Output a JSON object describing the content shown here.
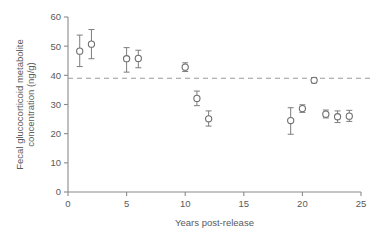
{
  "chart_data": {
    "type": "scatter",
    "title": "",
    "xlabel": "Years post-release",
    "ylabel": "Fecal glucocorticoid metabolite concentration (ng/g)",
    "ylabel_line1": "Fecal glucocorticoid metabolite",
    "ylabel_line2": "concentration (ng/g)",
    "xlim": [
      0,
      25
    ],
    "ylim": [
      0,
      60
    ],
    "xticks": [
      0,
      5,
      10,
      15,
      20,
      25
    ],
    "yticks": [
      0,
      10,
      20,
      30,
      40,
      50,
      60
    ],
    "xtick_labels": [
      "0",
      "5",
      "10",
      "15",
      "20",
      "25"
    ],
    "ytick_labels": [
      "0",
      "10",
      "20",
      "30",
      "40",
      "50",
      "60"
    ],
    "grid": false,
    "legend": "none",
    "marker_style": "open-circle",
    "error_bars": "vertical-with-caps",
    "reference_line": {
      "orientation": "horizontal",
      "value": 39,
      "style": "dashed",
      "label": ""
    },
    "x": [
      1,
      2,
      5,
      6,
      10,
      11,
      12,
      19,
      20,
      21,
      22,
      23,
      24
    ],
    "values": [
      48.3,
      50.7,
      45.7,
      45.8,
      42.8,
      32.1,
      25.1,
      24.5,
      28.6,
      38.3,
      26.7,
      25.8,
      26.0
    ],
    "error_low": [
      5.3,
      5.0,
      4.6,
      3.2,
      1.5,
      2.5,
      2.5,
      4.7,
      1.3,
      0.9,
      1.3,
      2.0,
      1.8
    ],
    "error_high": [
      5.5,
      5.0,
      3.8,
      2.8,
      1.5,
      2.5,
      2.7,
      4.4,
      1.3,
      0.9,
      1.4,
      2.0,
      2.0
    ],
    "points": [
      {
        "x": 1,
        "y": 48.3,
        "lo": 43.0,
        "hi": 53.8
      },
      {
        "x": 2,
        "y": 50.7,
        "lo": 45.7,
        "hi": 55.7
      },
      {
        "x": 5,
        "y": 45.7,
        "lo": 41.1,
        "hi": 49.5
      },
      {
        "x": 6,
        "y": 45.8,
        "lo": 42.6,
        "hi": 48.6
      },
      {
        "x": 10,
        "y": 42.8,
        "lo": 41.3,
        "hi": 44.3
      },
      {
        "x": 11,
        "y": 32.1,
        "lo": 29.6,
        "hi": 34.6
      },
      {
        "x": 12,
        "y": 25.1,
        "lo": 22.6,
        "hi": 27.8
      },
      {
        "x": 19,
        "y": 24.5,
        "lo": 19.8,
        "hi": 28.9
      },
      {
        "x": 20,
        "y": 28.6,
        "lo": 27.3,
        "hi": 29.9
      },
      {
        "x": 21,
        "y": 38.3,
        "lo": 37.4,
        "hi": 39.2
      },
      {
        "x": 22,
        "y": 26.7,
        "lo": 25.4,
        "hi": 28.1
      },
      {
        "x": 23,
        "y": 25.8,
        "lo": 23.8,
        "hi": 27.8
      },
      {
        "x": 24,
        "y": 26.0,
        "lo": 24.2,
        "hi": 28.0
      }
    ]
  }
}
